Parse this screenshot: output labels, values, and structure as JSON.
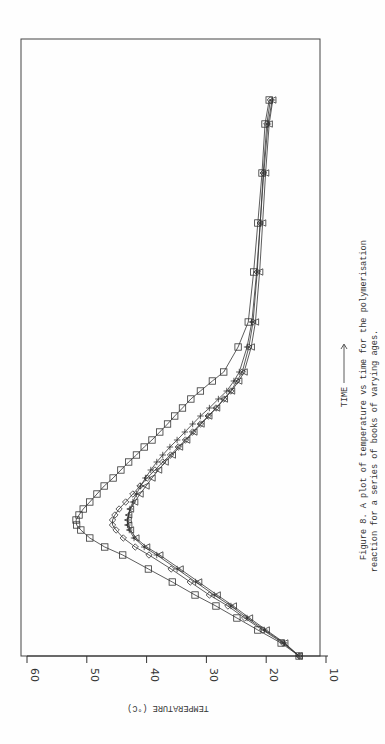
{
  "caption": {
    "line1": "Figure 8.  A plot of temperature vs time for the polymerisation",
    "line2": "reaction for a series of books of varying ages."
  },
  "chart_data": {
    "type": "line",
    "title": "Figure 8. A plot of temperature vs time for the polymerisation reaction for a series of books of varying ages.",
    "xlabel": "TIME",
    "ylabel": "TEMPERATURE (°C)",
    "ylim": [
      10,
      60
    ],
    "yticks": [
      60,
      50,
      40,
      30,
      20,
      10
    ],
    "orientation": "rotated 90° on page (time axis vertical, increasing upward)",
    "x_units": "time in arbitrary units (pixel distance along time axis from origin, unlabeled)",
    "grid": false,
    "legend": "none (series distinguished by marker: square, diamond, plus, triangle)",
    "series": [
      {
        "name": "square",
        "marker": "square",
        "x": [
          0,
          13,
          26,
          38,
          50,
          61,
          74,
          87,
          101,
          109,
          118,
          126,
          131,
          136,
          141,
          147,
          154,
          162,
          170,
          178,
          186,
          194,
          201,
          209,
          216,
          224,
          232,
          240,
          248,
          257,
          265,
          275,
          284,
          309,
          334,
          384,
          433,
          483,
          532,
          556
        ],
        "values": [
          14.5,
          17.5,
          21.4,
          24.9,
          28.4,
          31.9,
          35.7,
          39.7,
          44.0,
          47.0,
          49.5,
          51.0,
          51.7,
          51.8,
          51.3,
          50.6,
          49.5,
          48.3,
          47.1,
          45.6,
          44.3,
          43.0,
          41.7,
          40.4,
          39.1,
          37.8,
          36.5,
          35.3,
          34.0,
          32.6,
          31.0,
          29.0,
          27.1,
          24.7,
          23.0,
          22.1,
          21.4,
          20.7,
          20.2,
          19.5
        ]
      },
      {
        "name": "diamond",
        "marker": "diamond",
        "x": [
          0,
          13,
          26,
          38,
          50,
          61,
          74,
          87,
          101,
          109,
          118,
          126,
          131,
          136,
          141,
          147,
          154,
          162,
          170,
          178,
          186,
          194,
          201,
          209,
          216,
          224,
          232,
          240,
          248,
          257,
          265,
          275,
          284,
          309,
          334,
          384,
          433,
          483,
          532,
          556
        ],
        "values": [
          14.5,
          17.2,
          20.6,
          23.6,
          26.4,
          29.5,
          32.7,
          35.9,
          39.6,
          41.9,
          43.9,
          45.1,
          45.7,
          45.7,
          45.3,
          44.6,
          43.5,
          42.3,
          41.1,
          39.9,
          38.6,
          37.3,
          36.0,
          34.7,
          33.5,
          32.3,
          31.0,
          29.7,
          28.4,
          27.1,
          25.9,
          24.9,
          24.0,
          22.9,
          22.2,
          21.5,
          21.0,
          20.5,
          19.9,
          19.3
        ]
      },
      {
        "name": "plus",
        "marker": "plus",
        "x": [
          0,
          13,
          26,
          38,
          50,
          61,
          74,
          87,
          101,
          109,
          118,
          126,
          131,
          136,
          141,
          147,
          154,
          162,
          170,
          178,
          186,
          194,
          201,
          209,
          216,
          224,
          232,
          240,
          248,
          257,
          265,
          275,
          284,
          309,
          334,
          384,
          433,
          483,
          532,
          556
        ],
        "values": [
          14.5,
          17.0,
          20.3,
          23.2,
          25.9,
          28.7,
          31.8,
          34.9,
          38.3,
          40.4,
          42.1,
          42.9,
          43.2,
          43.2,
          43.0,
          42.8,
          42.3,
          41.7,
          41.0,
          40.2,
          39.3,
          38.3,
          37.3,
          36.1,
          34.9,
          33.6,
          32.3,
          31.0,
          29.5,
          28.0,
          26.6,
          25.4,
          24.5,
          23.2,
          22.4,
          21.6,
          21.0,
          20.4,
          19.7,
          19.0
        ]
      },
      {
        "name": "triangle",
        "marker": "triangle",
        "x": [
          0,
          13,
          26,
          38,
          50,
          61,
          74,
          87,
          101,
          109,
          118,
          126,
          131,
          136,
          141,
          147,
          154,
          162,
          170,
          178,
          186,
          194,
          201,
          209,
          216,
          224,
          232,
          240,
          248,
          257,
          265,
          275,
          284,
          309,
          334,
          384,
          433,
          483,
          532,
          556
        ],
        "values": [
          14.5,
          16.9,
          20.0,
          22.8,
          25.5,
          28.2,
          31.3,
          34.4,
          37.8,
          40.0,
          41.8,
          42.7,
          43.0,
          43.1,
          43.0,
          42.7,
          42.0,
          41.1,
          40.1,
          39.1,
          38.0,
          36.9,
          35.7,
          34.5,
          33.3,
          32.1,
          30.9,
          29.6,
          28.3,
          27.0,
          25.8,
          24.6,
          23.7,
          22.5,
          21.8,
          21.1,
          20.6,
          20.1,
          19.5,
          18.9
        ]
      }
    ]
  }
}
